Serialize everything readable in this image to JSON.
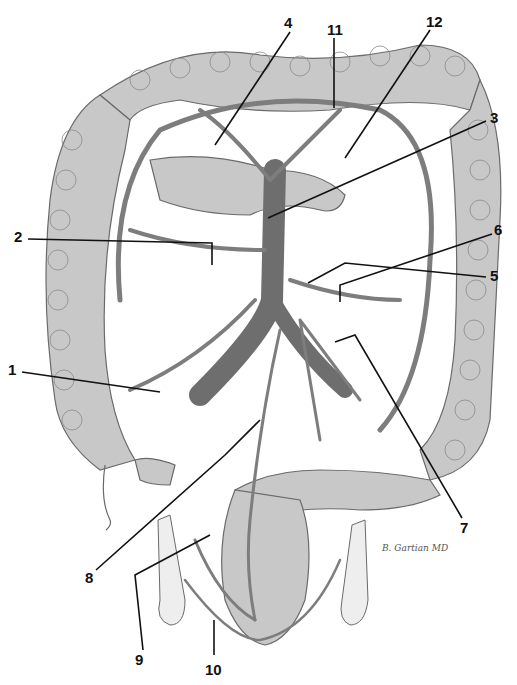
{
  "figure": {
    "signature": "B. Gartian MD",
    "colors": {
      "background": "#ffffff",
      "bowel_fill": "#c8c8c8",
      "bowel_outline": "#6a6a6a",
      "vessel": "#7d7d7d",
      "aorta": "#6e6e6e",
      "label_text": "#111111",
      "arrow": "#111111"
    }
  },
  "labels": [
    {
      "id": "1",
      "text": "1",
      "x": 8,
      "y": 368
    },
    {
      "id": "2",
      "text": "2",
      "x": 14,
      "y": 235
    },
    {
      "id": "3",
      "text": "3",
      "x": 490,
      "y": 117
    },
    {
      "id": "4",
      "text": "4",
      "x": 284,
      "y": 20
    },
    {
      "id": "5",
      "text": "5",
      "x": 490,
      "y": 275
    },
    {
      "id": "6",
      "text": "6",
      "x": 494,
      "y": 229
    },
    {
      "id": "7",
      "text": "7",
      "x": 460,
      "y": 518
    },
    {
      "id": "8",
      "text": "8",
      "x": 85,
      "y": 576
    },
    {
      "id": "9",
      "text": "9",
      "x": 135,
      "y": 660
    },
    {
      "id": "10",
      "text": "10",
      "x": 205,
      "y": 666
    },
    {
      "id": "11",
      "text": "11",
      "x": 327,
      "y": 22
    },
    {
      "id": "12",
      "text": "12",
      "x": 426,
      "y": 14
    }
  ]
}
